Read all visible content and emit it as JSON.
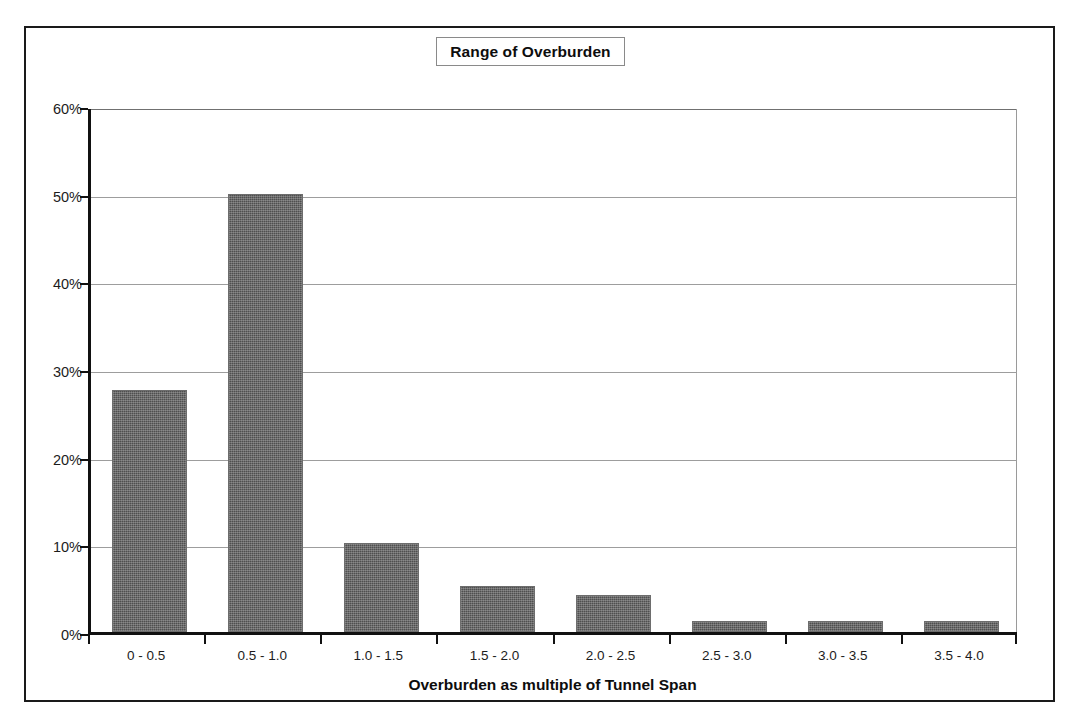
{
  "chart_data": {
    "type": "bar",
    "title": "Range of Overburden",
    "xlabel": "Overburden as multiple of Tunnel Span",
    "ylabel": "",
    "categories": [
      "0 - 0.5",
      "0.5 - 1.0",
      "1.0 - 1.5",
      "1.5 - 2.0",
      "2.0 - 2.5",
      "2.5 - 3.0",
      "3.0 - 3.5",
      "3.5 - 4.0"
    ],
    "values": [
      27.6,
      50.0,
      10.2,
      5.2,
      4.2,
      1.2,
      1.2,
      1.2
    ],
    "value_unit": "%",
    "ylim": [
      0,
      60
    ],
    "ytick_values": [
      0,
      10,
      20,
      30,
      40,
      50,
      60
    ],
    "ytick_labels": [
      "0%",
      "10%",
      "20%",
      "30%",
      "40%",
      "50%",
      "60%"
    ],
    "grid": true,
    "grid_axis": "y",
    "legend": false,
    "legend_position": "none",
    "series": [
      {
        "name": "Range of Overburden",
        "values": [
          27.6,
          50.0,
          10.2,
          5.2,
          4.2,
          1.2,
          1.2,
          1.2
        ]
      }
    ]
  },
  "colors": {
    "bar_fill": "#4f4f4f",
    "bar_border": "#6d6d6d",
    "axis_line": "#111111",
    "gridline": "#9d9d9d",
    "page_border": "#1a1a1a",
    "title_box_border": "#8a8a8a",
    "text": "#1c1c1c",
    "background": "#ffffff"
  }
}
